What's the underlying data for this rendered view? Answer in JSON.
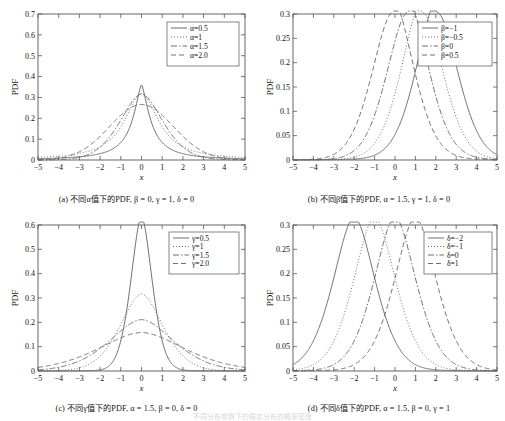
{
  "figure": {
    "panel_count": 4,
    "bottom_fragment": "不同分布参数下的稳定分布的概率密度"
  },
  "panels": [
    {
      "key": "a",
      "tag": "(a)",
      "caption": "(a) 不同α值下的PDF, β = 0, γ = 1, δ = 0",
      "caption_plain": "不同α值下的PDF",
      "xlabel": "x",
      "ylabel": "PDF",
      "xticks": [
        "-5",
        "-4",
        "-3",
        "-2",
        "-1",
        "0",
        "1",
        "2",
        "3",
        "4",
        "5"
      ],
      "yticks": [
        "0",
        "0.1",
        "0.2",
        "0.3",
        "0.4",
        "0.5",
        "0.6",
        "0.7"
      ],
      "legend": [
        "α=0.5",
        "α=1",
        "α=1.5",
        "α=2.0"
      ]
    },
    {
      "key": "b",
      "tag": "(b)",
      "caption": "(b) 不同β值下的PDF, α = 1.5, γ = 1, δ = 0",
      "caption_plain": "不同β值下的PDF",
      "xlabel": "x",
      "ylabel": "PDF",
      "xticks": [
        "-5",
        "-4",
        "-3",
        "-2",
        "-1",
        "0",
        "1",
        "2",
        "3",
        "4",
        "5"
      ],
      "yticks": [
        "0",
        "0.05",
        "0.1",
        "0.15",
        "0.2",
        "0.25",
        "0.3"
      ],
      "legend": [
        "β=-1",
        "β=-0.5",
        "β=0",
        "β=0.5"
      ]
    },
    {
      "key": "c",
      "tag": "(c)",
      "caption": "(c) 不同γ值下的PDF, α = 1.5, β = 0, δ = 0",
      "caption_plain": "不同γ值下的PDF",
      "xlabel": "x",
      "ylabel": "PDF",
      "xticks": [
        "-5",
        "-4",
        "-3",
        "-2",
        "-1",
        "0",
        "1",
        "2",
        "3",
        "4",
        "5"
      ],
      "yticks": [
        "0",
        "0.1",
        "0.2",
        "0.3",
        "0.4",
        "0.5",
        "0.6"
      ],
      "legend": [
        "γ=0.5",
        "γ=1",
        "γ=1.5",
        "γ=2.0"
      ]
    },
    {
      "key": "d",
      "tag": "(d)",
      "caption": "(d) 不同δ值下的PDF, α = 1.5, β = 0, γ = 1",
      "caption_plain": "不同δ值下的PDF",
      "xlabel": "x",
      "ylabel": "PDF",
      "xticks": [
        "-5",
        "-4",
        "-3",
        "-2",
        "-1",
        "0",
        "1",
        "2",
        "3",
        "4",
        "5"
      ],
      "yticks": [
        "0",
        "0.05",
        "0.1",
        "0.15",
        "0.2",
        "0.25",
        "0.3"
      ],
      "legend": [
        "δ=-2",
        "δ=-1",
        "δ=0",
        "δ=1"
      ]
    }
  ],
  "chart_data": [
    {
      "type": "line",
      "panel": "(a)",
      "title": "不同α值下的PDF, β = 0, γ = 1, δ = 0",
      "xlabel": "x",
      "ylabel": "PDF",
      "xlim": [
        -5,
        5
      ],
      "ylim": [
        0,
        0.7
      ],
      "xticks": [
        -5,
        -4,
        -3,
        -2,
        -1,
        0,
        1,
        2,
        3,
        4,
        5
      ],
      "yticks": [
        0,
        0.1,
        0.2,
        0.3,
        0.4,
        0.5,
        0.6,
        0.7
      ],
      "grid": false,
      "legend_position": "top-right",
      "x": [
        -5,
        -4.5,
        -4,
        -3.5,
        -3,
        -2.5,
        -2,
        -1.5,
        -1,
        -0.75,
        -0.5,
        -0.25,
        0,
        0.25,
        0.5,
        0.75,
        1,
        1.5,
        2,
        2.5,
        3,
        3.5,
        4,
        4.5,
        5
      ],
      "series": [
        {
          "name": "α=0.5",
          "style": "solid",
          "values": [
            0.009,
            0.011,
            0.014,
            0.018,
            0.025,
            0.036,
            0.055,
            0.094,
            0.178,
            0.252,
            0.36,
            0.51,
            0.635,
            0.51,
            0.36,
            0.252,
            0.178,
            0.094,
            0.055,
            0.036,
            0.025,
            0.018,
            0.014,
            0.011,
            0.009
          ]
        },
        {
          "name": "α=1",
          "style": "dotted",
          "values": [
            0.012,
            0.015,
            0.019,
            0.025,
            0.032,
            0.044,
            0.064,
            0.098,
            0.159,
            0.204,
            0.255,
            0.3,
            0.318,
            0.3,
            0.255,
            0.204,
            0.159,
            0.098,
            0.064,
            0.044,
            0.032,
            0.025,
            0.019,
            0.015,
            0.012
          ]
        },
        {
          "name": "α=1.5",
          "style": "dashdot",
          "values": [
            0.013,
            0.017,
            0.023,
            0.031,
            0.043,
            0.06,
            0.086,
            0.124,
            0.179,
            0.212,
            0.245,
            0.272,
            0.287,
            0.272,
            0.245,
            0.212,
            0.179,
            0.124,
            0.086,
            0.06,
            0.043,
            0.031,
            0.023,
            0.017,
            0.013
          ]
        },
        {
          "name": "α=2.0",
          "style": "dashed",
          "values": [
            0.01,
            0.017,
            0.027,
            0.042,
            0.065,
            0.095,
            0.13,
            0.172,
            0.215,
            0.234,
            0.25,
            0.262,
            0.266,
            0.262,
            0.25,
            0.234,
            0.215,
            0.172,
            0.13,
            0.095,
            0.065,
            0.042,
            0.027,
            0.017,
            0.01
          ]
        }
      ]
    },
    {
      "type": "line",
      "panel": "(b)",
      "title": "不同β值下的PDF, α = 1.5, γ = 1, δ = 0",
      "xlabel": "x",
      "ylabel": "PDF",
      "xlim": [
        -5,
        5
      ],
      "ylim": [
        0,
        0.3
      ],
      "xticks": [
        -5,
        -4,
        -3,
        -2,
        -1,
        0,
        1,
        2,
        3,
        4,
        5
      ],
      "yticks": [
        0,
        0.05,
        0.1,
        0.15,
        0.2,
        0.25,
        0.3
      ],
      "grid": false,
      "legend_position": "top-right",
      "x": [
        -5,
        -4.5,
        -4,
        -3.5,
        -3,
        -2.5,
        -2,
        -1.5,
        -1,
        -0.5,
        0,
        0.5,
        1,
        1.5,
        2,
        2.5,
        3,
        3.5,
        4,
        4.5,
        5
      ],
      "series": [
        {
          "name": "β=-1",
          "style": "solid",
          "peak_x": 1.1,
          "peak_y": 0.278,
          "values": [
            0.004,
            0.005,
            0.007,
            0.009,
            0.013,
            0.019,
            0.028,
            0.044,
            0.07,
            0.116,
            0.176,
            0.24,
            0.278,
            0.262,
            0.2,
            0.13,
            0.074,
            0.042,
            0.026,
            0.018,
            0.013
          ]
        },
        {
          "name": "β=-0.5",
          "style": "dotted",
          "peak_x": 0.55,
          "peak_y": 0.285,
          "values": [
            0.006,
            0.007,
            0.01,
            0.013,
            0.018,
            0.026,
            0.038,
            0.058,
            0.092,
            0.15,
            0.222,
            0.285,
            0.269,
            0.201,
            0.13,
            0.079,
            0.049,
            0.033,
            0.024,
            0.018,
            0.014
          ]
        },
        {
          "name": "β=0",
          "style": "dashdot",
          "peak_x": -0.05,
          "peak_y": 0.287,
          "values": [
            0.008,
            0.01,
            0.014,
            0.019,
            0.026,
            0.037,
            0.055,
            0.082,
            0.13,
            0.207,
            0.287,
            0.25,
            0.168,
            0.1,
            0.059,
            0.038,
            0.026,
            0.019,
            0.015,
            0.012,
            0.01
          ]
        },
        {
          "name": "β=0.5",
          "style": "dashed",
          "peak_x": -0.7,
          "peak_y": 0.287,
          "values": [
            0.011,
            0.015,
            0.02,
            0.028,
            0.04,
            0.06,
            0.092,
            0.148,
            0.23,
            0.284,
            0.226,
            0.142,
            0.083,
            0.05,
            0.033,
            0.024,
            0.018,
            0.015,
            0.012,
            0.01,
            0.009
          ]
        }
      ]
    },
    {
      "type": "line",
      "panel": "(c)",
      "title": "不同γ值下的PDF, α = 1.5, β = 0, δ = 0",
      "xlabel": "x",
      "ylabel": "PDF",
      "xlim": [
        -5,
        5
      ],
      "ylim": [
        0,
        0.6
      ],
      "xticks": [
        -5,
        -4,
        -3,
        -2,
        -1,
        0,
        1,
        2,
        3,
        4,
        5
      ],
      "yticks": [
        0,
        0.1,
        0.2,
        0.3,
        0.4,
        0.5,
        0.6
      ],
      "grid": false,
      "legend_position": "top-right",
      "x": [
        -5,
        -4.5,
        -4,
        -3.5,
        -3,
        -2.5,
        -2,
        -1.5,
        -1,
        -0.75,
        -0.5,
        -0.25,
        0,
        0.25,
        0.5,
        0.75,
        1,
        1.5,
        2,
        2.5,
        3,
        3.5,
        4,
        4.5,
        5
      ],
      "series": [
        {
          "name": "γ=0.5",
          "style": "solid",
          "peak_y": 0.575,
          "values": [
            0.005,
            0.006,
            0.008,
            0.011,
            0.016,
            0.024,
            0.038,
            0.068,
            0.14,
            0.218,
            0.33,
            0.48,
            0.575,
            0.48,
            0.33,
            0.218,
            0.14,
            0.068,
            0.038,
            0.024,
            0.016,
            0.011,
            0.008,
            0.006,
            0.005
          ]
        },
        {
          "name": "γ=1",
          "style": "dotted",
          "peak_y": 0.29,
          "values": [
            0.013,
            0.017,
            0.023,
            0.031,
            0.043,
            0.06,
            0.086,
            0.124,
            0.179,
            0.212,
            0.245,
            0.275,
            0.29,
            0.275,
            0.245,
            0.212,
            0.179,
            0.124,
            0.086,
            0.06,
            0.043,
            0.031,
            0.023,
            0.017,
            0.013
          ]
        },
        {
          "name": "γ=1.5",
          "style": "dashdot",
          "peak_y": 0.193,
          "values": [
            0.019,
            0.024,
            0.031,
            0.04,
            0.053,
            0.07,
            0.092,
            0.119,
            0.15,
            0.165,
            0.178,
            0.188,
            0.193,
            0.188,
            0.178,
            0.165,
            0.15,
            0.119,
            0.092,
            0.07,
            0.053,
            0.04,
            0.031,
            0.024,
            0.019
          ]
        },
        {
          "name": "γ=2.0",
          "style": "dashed",
          "peak_y": 0.146,
          "values": [
            0.026,
            0.031,
            0.039,
            0.048,
            0.06,
            0.074,
            0.091,
            0.108,
            0.126,
            0.134,
            0.14,
            0.144,
            0.146,
            0.144,
            0.14,
            0.134,
            0.126,
            0.108,
            0.091,
            0.074,
            0.06,
            0.048,
            0.039,
            0.031,
            0.026
          ]
        }
      ]
    },
    {
      "type": "line",
      "panel": "(d)",
      "title": "不同δ值下的PDF, α = 1.5, β = 0, γ = 1",
      "xlabel": "x",
      "ylabel": "PDF",
      "xlim": [
        -5,
        5
      ],
      "ylim": [
        0,
        0.3
      ],
      "xticks": [
        -5,
        -4,
        -3,
        -2,
        -1,
        0,
        1,
        2,
        3,
        4,
        5
      ],
      "yticks": [
        0,
        0.05,
        0.1,
        0.15,
        0.2,
        0.25,
        0.3
      ],
      "grid": false,
      "legend_position": "top-right",
      "x": [
        -5,
        -4.5,
        -4,
        -3.5,
        -3,
        -2.5,
        -2,
        -1.5,
        -1,
        -0.5,
        0,
        0.5,
        1,
        1.5,
        2,
        2.5,
        3,
        3.5,
        4,
        4.5,
        5
      ],
      "series": [
        {
          "name": "δ=-2",
          "style": "solid",
          "peak_x": -2,
          "peak_y": 0.287
        },
        {
          "name": "δ=-1",
          "style": "dotted",
          "peak_x": -1,
          "peak_y": 0.287
        },
        {
          "name": "δ=0",
          "style": "dashdot",
          "peak_x": 0,
          "peak_y": 0.287
        },
        {
          "name": "δ=1",
          "style": "dashed",
          "peak_x": 1,
          "peak_y": 0.287
        }
      ]
    }
  ]
}
